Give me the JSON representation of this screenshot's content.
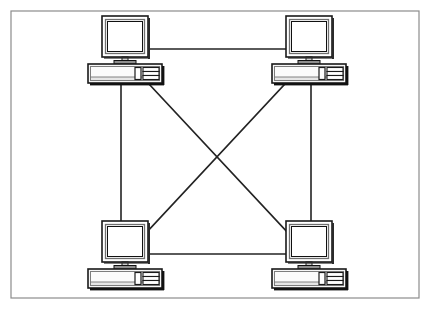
{
  "diagram": {
    "title": "Mesh network topology",
    "type": "network-topology",
    "topology": "full-mesh",
    "node_count": 4,
    "link_count": 6,
    "background_color": "#ffffff",
    "frame": {
      "label": "diagram frame",
      "x": 11,
      "y": 11,
      "width": 408,
      "height": 287,
      "stroke_color": "#8c8c8c",
      "stroke_width": 1.2,
      "fill_color": "#ffffff"
    },
    "link_style": {
      "stroke_color": "#232323",
      "stroke_width": 1.6
    },
    "node_style": {
      "outline_color": "#1a1a1a",
      "inner_outline_color": "#6b6b6b",
      "screen_fill": "#ffffff",
      "case_fill": "#f4f4f4",
      "shadow_color": "#111111"
    },
    "nodes": [
      {
        "id": "pc-top-left",
        "label": "Computer top left",
        "position": "top-left",
        "x": 88,
        "y": 16,
        "monitor_x": 14,
        "monitor_y": 0,
        "monitor_w": 46,
        "monitor_h": 41,
        "case_x": 0,
        "case_y": 48,
        "case_w": 74,
        "case_h": 19
      },
      {
        "id": "pc-top-right",
        "label": "Computer top right",
        "position": "top-right",
        "x": 272,
        "y": 16,
        "monitor_x": 14,
        "monitor_y": 0,
        "monitor_w": 46,
        "monitor_h": 41,
        "case_x": 0,
        "case_y": 48,
        "case_w": 74,
        "case_h": 19
      },
      {
        "id": "pc-bottom-left",
        "label": "Computer bottom left",
        "position": "bottom-left",
        "x": 88,
        "y": 221,
        "monitor_x": 14,
        "monitor_y": 0,
        "monitor_w": 46,
        "monitor_h": 41,
        "case_x": 0,
        "case_y": 48,
        "case_w": 74,
        "case_h": 19
      },
      {
        "id": "pc-bottom-right",
        "label": "Computer bottom right",
        "position": "bottom-right",
        "x": 272,
        "y": 221,
        "monitor_x": 14,
        "monitor_y": 0,
        "monitor_w": 46,
        "monitor_h": 41,
        "case_x": 0,
        "case_y": 48,
        "case_w": 74,
        "case_h": 19
      }
    ],
    "links": [
      {
        "id": "link-top",
        "label": "Link top left to top right",
        "from": "pc-top-left",
        "to": "pc-top-right",
        "orientation": "horizontal",
        "x1": 148,
        "y1": 49,
        "x2": 286,
        "y2": 49
      },
      {
        "id": "link-bottom",
        "label": "Link bottom left to bottom right",
        "from": "pc-bottom-left",
        "to": "pc-bottom-right",
        "orientation": "horizontal",
        "x1": 148,
        "y1": 254,
        "x2": 286,
        "y2": 254
      },
      {
        "id": "link-left",
        "label": "Link top left to bottom left",
        "from": "pc-top-left",
        "to": "pc-bottom-left",
        "orientation": "vertical",
        "x1": 121,
        "y1": 84,
        "x2": 121,
        "y2": 232
      },
      {
        "id": "link-right",
        "label": "Link top right to bottom right",
        "from": "pc-top-right",
        "to": "pc-bottom-right",
        "orientation": "vertical",
        "x1": 311,
        "y1": 84,
        "x2": 311,
        "y2": 232
      },
      {
        "id": "link-diagonal-down",
        "label": "Link top left to bottom right",
        "from": "pc-top-left",
        "to": "pc-bottom-right",
        "orientation": "diagonal",
        "x1": 149,
        "y1": 84,
        "x2": 290,
        "y2": 235
      },
      {
        "id": "link-diagonal-up",
        "label": "Link top right to bottom left",
        "from": "pc-top-right",
        "to": "pc-bottom-left",
        "orientation": "diagonal",
        "x1": 285,
        "y1": 84,
        "x2": 145,
        "y2": 234
      }
    ],
    "crossing_point": {
      "label": "diagonal crossing",
      "x": 217,
      "y": 159
    }
  }
}
